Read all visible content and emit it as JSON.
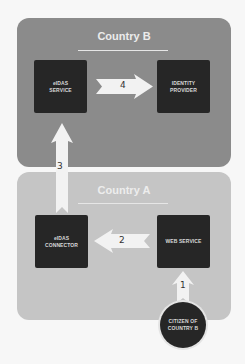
{
  "diagram": {
    "regions": {
      "country_b": {
        "title": "Country B",
        "color": "#8b8b8b"
      },
      "country_a": {
        "title": "Country A",
        "color": "#c5c5c5"
      }
    },
    "nodes": {
      "eidas_service": {
        "label": "eIDAS\nSERVICE"
      },
      "identity_provider": {
        "label": "IDENTITY\nPROVIDER"
      },
      "eidas_connector": {
        "label": "eIDAS\nCONNECTOR"
      },
      "web_service": {
        "label": "WEB SERVICE"
      },
      "citizen": {
        "label": "CITIZEN OF\nCOUNTRY B"
      }
    },
    "arrows": [
      {
        "step": "1",
        "from": "citizen",
        "to": "web_service"
      },
      {
        "step": "2",
        "from": "web_service",
        "to": "eidas_connector"
      },
      {
        "step": "3",
        "from": "eidas_connector",
        "to": "eidas_service"
      },
      {
        "step": "4",
        "from": "eidas_service",
        "to": "identity_provider"
      }
    ],
    "colors": {
      "node_fill": "#262626",
      "arrow_fill": "#f2f2f2",
      "label_text": "#d8d8d8"
    }
  }
}
